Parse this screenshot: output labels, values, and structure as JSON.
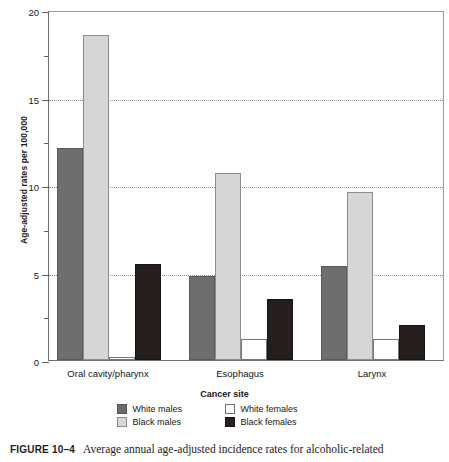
{
  "chart_data": {
    "type": "bar",
    "title": "",
    "xlabel": "Cancer site",
    "ylabel": "Age-adjusted rates per 100,000",
    "ylim": [
      0,
      20
    ],
    "yticks": [
      0,
      5,
      10,
      15,
      20
    ],
    "ytick_labels": [
      "0",
      "5",
      "10",
      "15",
      "20"
    ],
    "yminor_ticks": [
      2.5,
      7.5,
      12.5,
      17.5
    ],
    "grid": "horizontal-dotted",
    "legend_position": "bottom",
    "categories": [
      "Oral cavity/pharynx",
      "Esophagus",
      "Larynx"
    ],
    "series": [
      {
        "name": "White males",
        "key": "wm",
        "color": "#6e6e6e",
        "values": [
          12.1,
          4.8,
          5.4
        ]
      },
      {
        "name": "White females",
        "key": "wf",
        "color": "#ffffff",
        "values": [
          0.15,
          1.2,
          1.2
        ]
      },
      {
        "name": "Black males",
        "key": "bm",
        "color": "#d6d6d6",
        "values": [
          18.6,
          10.7,
          9.6
        ]
      },
      {
        "name": "Black females",
        "key": "bf",
        "color": "#241e1c",
        "values": [
          5.5,
          3.5,
          2.0
        ]
      }
    ],
    "bar_draw_order": [
      "wm",
      "bm",
      "wf",
      "bf"
    ]
  },
  "legend": {
    "rows": [
      {
        "left": "White males",
        "right": "White females"
      },
      {
        "left": "Black males",
        "right": "Black females"
      }
    ]
  },
  "caption": {
    "figure_number": "FIGURE 10–4",
    "text": "Average annual age-adjusted incidence rates for alcoholic-related"
  }
}
